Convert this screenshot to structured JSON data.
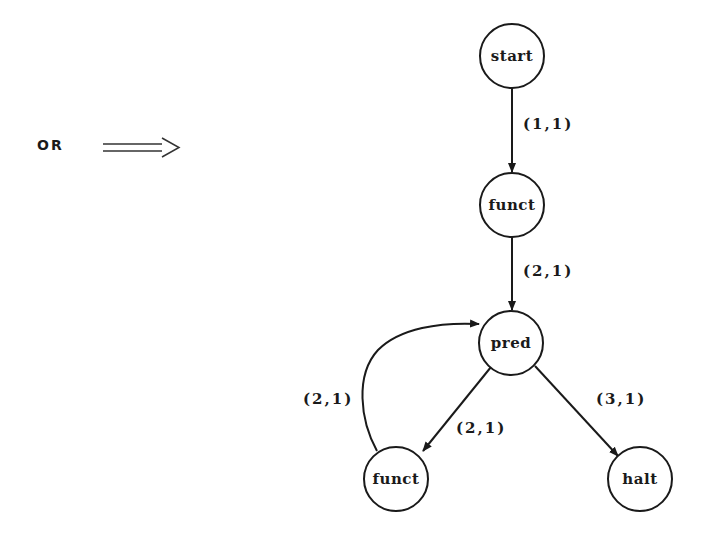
{
  "diagram": {
    "type": "flowgraph",
    "prefix": {
      "label": "OR",
      "arrow_icon": "double-right-arrow-icon"
    },
    "nodes": [
      {
        "id": "start",
        "label": "start",
        "cx": 512,
        "cy": 56
      },
      {
        "id": "funct1",
        "label": "funct",
        "cx": 512,
        "cy": 205
      },
      {
        "id": "pred",
        "label": "pred",
        "cx": 511,
        "cy": 343
      },
      {
        "id": "funct2",
        "label": "funct",
        "cx": 396,
        "cy": 479
      },
      {
        "id": "halt",
        "label": "halt",
        "cx": 640,
        "cy": 479
      }
    ],
    "edges": [
      {
        "from": "start",
        "to": "funct1",
        "label": "(1,1)"
      },
      {
        "from": "funct1",
        "to": "pred",
        "label": "(2,1)"
      },
      {
        "from": "pred",
        "to": "funct2",
        "label": "(2,1)"
      },
      {
        "from": "pred",
        "to": "halt",
        "label": "(3,1)"
      },
      {
        "from": "funct2",
        "to": "pred",
        "label": "(2,1)",
        "curved": true
      }
    ]
  }
}
